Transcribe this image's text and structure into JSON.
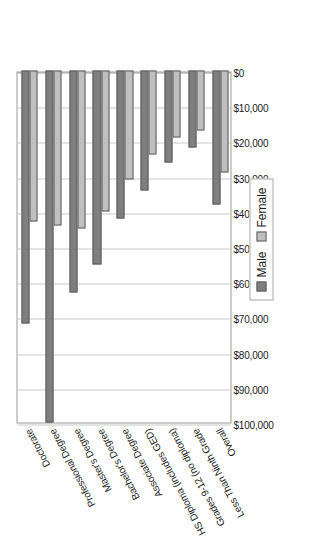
{
  "chart_data": {
    "type": "bar",
    "orientation": "horizontal",
    "title": "",
    "subtitle": "",
    "xlabel": "",
    "ylabel": "",
    "xlim": [
      0,
      100000
    ],
    "grid": true,
    "legend_position": "bottom-right",
    "categories": [
      "Overall",
      "Less Than Ninth Grade",
      "Grades 9-12 (no diploma)",
      "HS Diploma (includes GED)",
      "Associate Degree",
      "Bachelor's Degree",
      "Master's Degree",
      "Professional Degree",
      "Doctorate"
    ],
    "tick_labels": [
      "$0",
      "$10,000",
      "$20,000",
      "$30,000",
      "$40,000",
      "$50,000",
      "$60,000",
      "$70,000",
      "$80,000",
      "$90,000",
      "$100,000"
    ],
    "tick_values": [
      0,
      10000,
      20000,
      30000,
      40000,
      50000,
      60000,
      70000,
      80000,
      90000,
      100000
    ],
    "series": [
      {
        "name": "Male",
        "color": "#7f7f7f",
        "values": [
          38000,
          22000,
          26000,
          34000,
          42000,
          55000,
          63000,
          100000,
          72000
        ]
      },
      {
        "name": "Female",
        "color": "#bfbfbf",
        "values": [
          29000,
          17000,
          19000,
          24000,
          31000,
          40000,
          45000,
          44000,
          43000
        ]
      }
    ]
  },
  "legend": {
    "entries": [
      {
        "label": "Male",
        "swatch": "male-swatch"
      },
      {
        "label": "Female",
        "swatch": "female-swatch"
      }
    ]
  }
}
